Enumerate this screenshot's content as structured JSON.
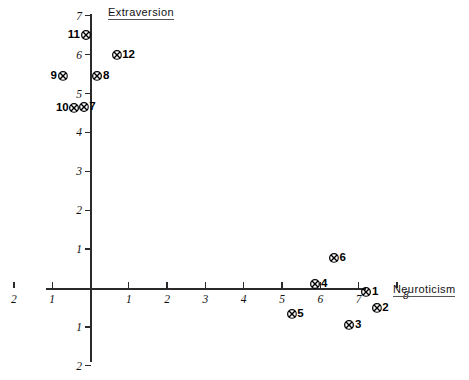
{
  "chart_data": {
    "type": "scatter",
    "title": "",
    "xlabel": "Neuroticism",
    "ylabel": "Extraversion",
    "xlim": [
      -2.3,
      8.4
    ],
    "ylim": [
      -2.3,
      7.2
    ],
    "grid": false,
    "legend": "none",
    "x_ticks": [
      {
        "label": "2",
        "value": -2
      },
      {
        "label": "1",
        "value": -1
      },
      {
        "label": "1",
        "value": 1
      },
      {
        "label": "2",
        "value": 2
      },
      {
        "label": "3",
        "value": 3
      },
      {
        "label": "4",
        "value": 4
      },
      {
        "label": "5",
        "value": 5
      },
      {
        "label": "6",
        "value": 6
      },
      {
        "label": "7",
        "value": 7
      },
      {
        "label": "8",
        "value": 8
      }
    ],
    "y_ticks": [
      {
        "label": "7",
        "value": 7
      },
      {
        "label": "6",
        "value": 6
      },
      {
        "label": "5",
        "value": 5
      },
      {
        "label": "4",
        "value": 4
      },
      {
        "label": "3",
        "value": 3
      },
      {
        "label": "2",
        "value": 2
      },
      {
        "label": "1",
        "value": 1
      },
      {
        "label": "1",
        "value": -1
      },
      {
        "label": "2",
        "value": -2
      }
    ],
    "marker_style": "circled-x",
    "points": [
      {
        "label": "1",
        "x": 7.2,
        "y": -0.1,
        "label_side": "right"
      },
      {
        "label": "2",
        "x": 7.47,
        "y": -0.51,
        "label_side": "right"
      },
      {
        "label": "3",
        "x": 6.76,
        "y": -0.95,
        "label_side": "right"
      },
      {
        "label": "4",
        "x": 5.87,
        "y": 0.1,
        "label_side": "right"
      },
      {
        "label": "5",
        "x": 5.25,
        "y": -0.67,
        "label_side": "right"
      },
      {
        "label": "6",
        "x": 6.35,
        "y": 0.77,
        "label_side": "right"
      },
      {
        "label": "7",
        "x": -0.18,
        "y": 4.65,
        "label_side": "right"
      },
      {
        "label": "8",
        "x": 0.18,
        "y": 5.45,
        "label_side": "right"
      },
      {
        "label": "9",
        "x": -0.73,
        "y": 5.45,
        "label_side": "left"
      },
      {
        "label": "10",
        "x": -0.42,
        "y": 4.63,
        "label_side": "left"
      },
      {
        "label": "11",
        "x": -0.13,
        "y": 6.5,
        "label_side": "left"
      },
      {
        "label": "12",
        "x": 0.68,
        "y": 5.99,
        "label_side": "right"
      }
    ]
  },
  "colors": {
    "axis": "#2a2a2a",
    "marker": "#000000",
    "text": "#111111",
    "background": "#ffffff"
  }
}
